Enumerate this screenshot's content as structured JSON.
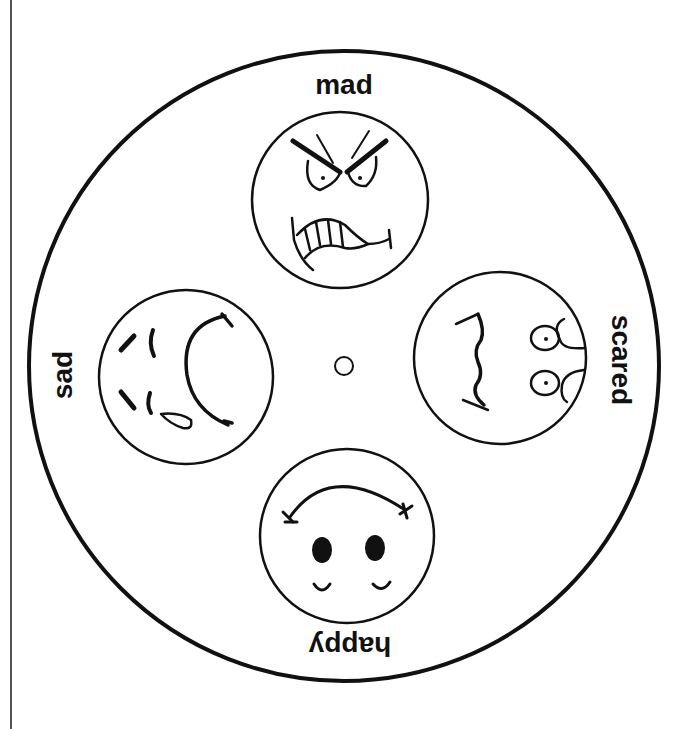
{
  "wheel": {
    "center_hole": "center-hole",
    "emotions": [
      {
        "label": "mad",
        "position": "top",
        "face": "angry-face-icon"
      },
      {
        "label": "scared",
        "position": "right",
        "face": "scared-face-icon"
      },
      {
        "label": "happy",
        "position": "bottom",
        "face": "happy-face-icon"
      },
      {
        "label": "sad",
        "position": "left",
        "face": "sad-face-icon"
      }
    ]
  },
  "colors": {
    "ink": "#111111",
    "paper": "#ffffff"
  }
}
